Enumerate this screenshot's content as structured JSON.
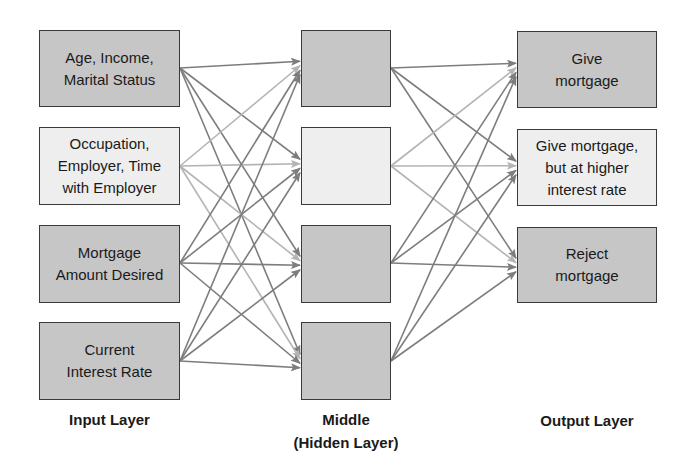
{
  "diagram": {
    "type": "neural-network",
    "colors": {
      "dark_fill": "#c6c6c6",
      "light_fill": "#eeeeee",
      "border": "#3a3a3a",
      "edge_dark": "#7d7d7d",
      "edge_light": "#b4b4b4"
    },
    "layers": {
      "input": {
        "label": "Input Layer",
        "nodes": [
          {
            "label": "Age, Income,\nMarital Status",
            "shade": "dark"
          },
          {
            "label": "Occupation,\nEmployer, Time\nwith Employer",
            "shade": "light"
          },
          {
            "label": "Mortgage\nAmount Desired",
            "shade": "dark"
          },
          {
            "label": "Current\nInterest Rate",
            "shade": "dark"
          }
        ]
      },
      "hidden": {
        "label": "Middle\n(Hidden Layer)",
        "nodes": [
          {
            "label": "",
            "shade": "dark"
          },
          {
            "label": "",
            "shade": "light"
          },
          {
            "label": "",
            "shade": "dark"
          },
          {
            "label": "",
            "shade": "dark"
          }
        ]
      },
      "output": {
        "label": "Output Layer",
        "nodes": [
          {
            "label": "Give\nmortgage",
            "shade": "dark"
          },
          {
            "label": "Give mortgage,\nbut at higher\ninterest rate",
            "shade": "light"
          },
          {
            "label": "Reject\nmortgage",
            "shade": "dark"
          }
        ]
      }
    },
    "connections": "fully-connected input→hidden (4×4) and hidden→output (4×3), directed arrows"
  }
}
